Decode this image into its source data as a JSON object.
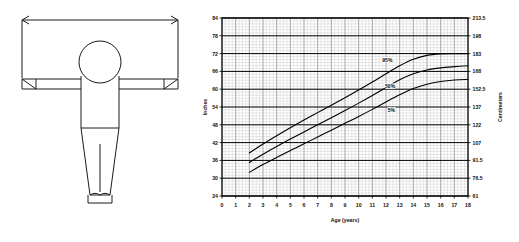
{
  "figure": {
    "name": "arm-span-body-diagram",
    "measurement_arrow": "double-headed horizontal arrow spanning fingertip to fingertip",
    "parts": [
      "head",
      "torso",
      "left-arm",
      "right-arm",
      "left-leg",
      "right-leg",
      "left-foot",
      "right-foot"
    ]
  },
  "chart_data": {
    "type": "line",
    "title": "",
    "xlabel": "Age (years)",
    "ylabel": "Inches",
    "ylabel_right": "Centimeters",
    "grid": true,
    "legend": "inline-labels",
    "xlim": [
      0,
      18
    ],
    "ylim": [
      24,
      84
    ],
    "xticks": [
      "0",
      "1",
      "2",
      "3",
      "4",
      "5",
      "6",
      "7",
      "8",
      "9",
      "10",
      "11",
      "12",
      "13",
      "14",
      "15",
      "16",
      "17",
      "18"
    ],
    "yticks_left": [
      "24",
      "30",
      "36",
      "42",
      "48",
      "54",
      "60",
      "66",
      "72",
      "78",
      "84"
    ],
    "yticks_right": [
      "61",
      "76.5",
      "91.5",
      "107",
      "122",
      "137",
      "152.5",
      "168",
      "183",
      "198",
      "213.5"
    ],
    "x": [
      2,
      3,
      4,
      5,
      6,
      7,
      8,
      9,
      10,
      11,
      12,
      13,
      14,
      15,
      16,
      17,
      18
    ],
    "series": [
      {
        "name": "95%",
        "label": "95%",
        "label_x": 12.1,
        "label_y": 69.2,
        "values": [
          38.5,
          41.5,
          44.3,
          47.0,
          49.6,
          52.1,
          54.6,
          57.1,
          59.7,
          62.4,
          65.2,
          67.9,
          70.1,
          71.4,
          71.9,
          72.0,
          72.0
        ]
      },
      {
        "name": "50%",
        "label": "50%",
        "label_x": 12.3,
        "label_y": 60.5,
        "values": [
          35.3,
          38.1,
          40.7,
          43.2,
          45.6,
          48.0,
          50.4,
          52.8,
          55.3,
          57.9,
          60.6,
          63.2,
          65.2,
          66.5,
          67.2,
          67.6,
          67.9
        ]
      },
      {
        "name": "5%",
        "label": "5%",
        "label_x": 12.4,
        "label_y": 52.2,
        "values": [
          32.0,
          34.6,
          37.0,
          39.3,
          41.6,
          43.9,
          46.2,
          48.5,
          50.8,
          53.2,
          55.7,
          58.1,
          60.2,
          61.7,
          62.6,
          63.1,
          63.3
        ]
      }
    ]
  }
}
